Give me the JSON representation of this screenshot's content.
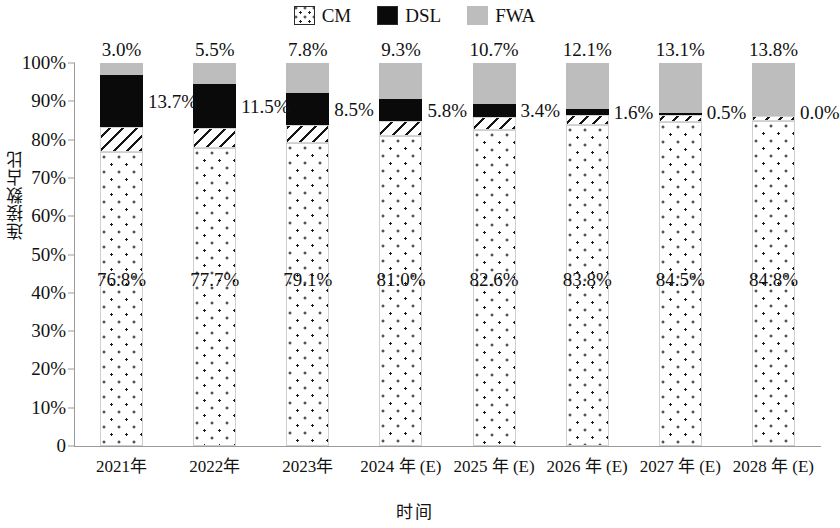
{
  "legend": {
    "items": [
      {
        "label": "CM",
        "icon": "dotted-square-icon",
        "color": "#ffffff"
      },
      {
        "label": "DSL",
        "icon": "black-square-icon",
        "color": "#0a0a0a"
      },
      {
        "label": "FWA",
        "icon": "gray-square-icon",
        "color": "#bdbdbd"
      }
    ]
  },
  "axes": {
    "ylabel": "连接数占比",
    "xlabel": "时间",
    "yticks": [
      "0",
      "10%",
      "20%",
      "30%",
      "40%",
      "50%",
      "60%",
      "70%",
      "80%",
      "90%",
      "100%"
    ]
  },
  "chart_data": {
    "type": "bar",
    "stacked": true,
    "normalized": true,
    "title": "",
    "xlabel": "时间",
    "ylabel": "连接数占比",
    "ylim": [
      0,
      100
    ],
    "ytick_values": [
      0,
      10,
      20,
      30,
      40,
      50,
      60,
      70,
      80,
      90,
      100
    ],
    "grid": false,
    "legend_position": "top-center",
    "categories": [
      "2021年",
      "2022年",
      "2023年",
      "2024 年 (E)",
      "2025 年 (E)",
      "2026 年 (E)",
      "2027 年 (E)",
      "2028 年 (E)"
    ],
    "series": [
      {
        "name": "CM",
        "values": [
          76.8,
          77.7,
          79.1,
          81.0,
          82.6,
          83.8,
          84.5,
          84.8
        ],
        "labels": [
          "76.8%",
          "77.7%",
          "79.1%",
          "81.0%",
          "82.6%",
          "83.8%",
          "84.5%",
          "84.8%"
        ]
      },
      {
        "name": "Other",
        "values": [
          6.5,
          5.3,
          4.6,
          3.9,
          3.3,
          2.5,
          1.9,
          1.4
        ],
        "labels": [
          "",
          "",
          "",
          "",
          "",
          "",
          "",
          ""
        ]
      },
      {
        "name": "DSL",
        "values": [
          13.7,
          11.5,
          8.5,
          5.8,
          3.4,
          1.6,
          0.5,
          0.0
        ],
        "labels": [
          "13.7%",
          "11.5%",
          "8.5%",
          "5.8%",
          "3.4%",
          "1.6%",
          "0.5%",
          "0.0%"
        ]
      },
      {
        "name": "FWA",
        "values": [
          3.0,
          5.5,
          7.8,
          9.3,
          10.7,
          12.1,
          13.1,
          13.8
        ],
        "labels": [
          "3.0%",
          "5.5%",
          "7.8%",
          "9.3%",
          "10.7%",
          "12.1%",
          "13.1%",
          "13.8%"
        ]
      }
    ]
  }
}
